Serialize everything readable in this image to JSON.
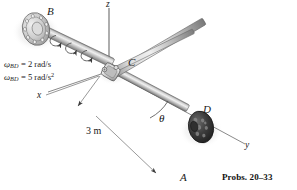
{
  "figure": {
    "title_caption": "Probs. 20–33",
    "points": {
      "B": "B",
      "C": "C",
      "D": "D",
      "A": "A"
    },
    "axes": {
      "x": "x",
      "y": "y",
      "z": "z"
    },
    "angle_label": "θ",
    "dimension": "3 m",
    "kinematics": {
      "omega_symbol": "ω",
      "omega_subscript": "BD",
      "omega_value": "= 2 rad/s",
      "alpha_symbol": "ω",
      "alpha_dot": "˙",
      "alpha_subscript": "BD",
      "alpha_value_num": "= 5 rad/s",
      "alpha_value_exp": "2"
    },
    "colors": {
      "rod_light": "#d8d8d8",
      "rod_mid": "#a9a9a9",
      "rod_dark": "#6e6e6e",
      "disk_b": "#c9c9c9",
      "disk_d": "#3a3a3a",
      "line": "#555555",
      "text": "#1a1a1a"
    }
  }
}
